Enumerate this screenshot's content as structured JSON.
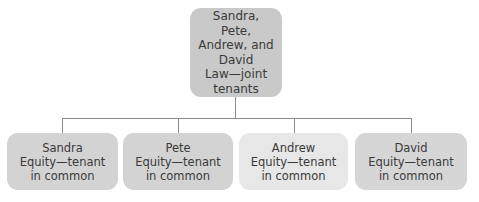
{
  "diagram": {
    "root": {
      "lines": [
        "Sandra, Pete,",
        "Andrew, and",
        "David",
        "Law—joint",
        "tenants"
      ],
      "color": "#c9c9c9"
    },
    "children": [
      {
        "name": "Sandra",
        "line2": "Equity—tenant",
        "line3": "in common",
        "color": "#d3d3d3"
      },
      {
        "name": "Pete",
        "line2": "Equity—tenant",
        "line3": "in common",
        "color": "#d3d3d3"
      },
      {
        "name": "Andrew",
        "line2": "Equity—tenant",
        "line3": "in common",
        "color": "#e7e7e7"
      },
      {
        "name": "David",
        "line2": "Equity—tenant",
        "line3": "in common",
        "color": "#d6d6d6"
      }
    ],
    "connector_color": "#8a8a8a"
  }
}
